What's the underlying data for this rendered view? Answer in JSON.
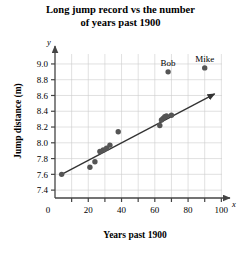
{
  "chart_data": {
    "type": "scatter",
    "title": "Long jump record vs the number of years past 1900",
    "title_line1": "Long jump record vs the number",
    "title_line2": "of years past 1900",
    "xlabel": "Years past 1900",
    "ylabel": "Jump distance (m)",
    "x_axis_letter": "x",
    "y_axis_letter": "y",
    "origin_label": "0",
    "xlim": [
      0,
      104
    ],
    "ylim": [
      7.3,
      9.05
    ],
    "xticks": [
      0,
      20,
      40,
      60,
      80,
      100
    ],
    "xtick_labels": [
      "0",
      "20",
      "40",
      "60",
      "80",
      "100"
    ],
    "xminor_ticks": [
      10,
      30,
      50,
      70,
      90
    ],
    "yticks": [
      7.4,
      7.6,
      7.8,
      8.0,
      8.2,
      8.4,
      8.6,
      8.8,
      9.0
    ],
    "ytick_labels": [
      "7.4",
      "7.6",
      "7.8",
      "8.0",
      "8.2",
      "8.4",
      "8.6",
      "8.8",
      "9.0"
    ],
    "grid": true,
    "legend": "none",
    "point_color": "#555555",
    "line_color": "#333333",
    "grid_color": "#cccccc",
    "axis_color": "#444444",
    "points": [
      {
        "x": 4,
        "y": 7.6,
        "label": ""
      },
      {
        "x": 21,
        "y": 7.69,
        "label": ""
      },
      {
        "x": 24,
        "y": 7.76,
        "label": ""
      },
      {
        "x": 27,
        "y": 7.89,
        "label": ""
      },
      {
        "x": 29,
        "y": 7.91,
        "label": ""
      },
      {
        "x": 31,
        "y": 7.93,
        "label": ""
      },
      {
        "x": 33,
        "y": 7.97,
        "label": ""
      },
      {
        "x": 38,
        "y": 8.14,
        "label": ""
      },
      {
        "x": 63,
        "y": 8.22,
        "label": ""
      },
      {
        "x": 64,
        "y": 8.29,
        "label": ""
      },
      {
        "x": 65,
        "y": 8.31,
        "label": ""
      },
      {
        "x": 66,
        "y": 8.33,
        "label": ""
      },
      {
        "x": 67,
        "y": 8.34,
        "label": ""
      },
      {
        "x": 70,
        "y": 8.35,
        "label": ""
      },
      {
        "x": 68,
        "y": 8.9,
        "label": "Bob"
      },
      {
        "x": 90,
        "y": 8.95,
        "label": "Mike"
      }
    ],
    "trend_line": {
      "x_start": 4,
      "y_start": 7.6,
      "x_end": 96,
      "y_end": 8.62,
      "arrow": true
    }
  }
}
